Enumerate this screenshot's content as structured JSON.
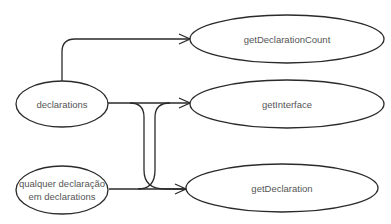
{
  "diagram": {
    "type": "flow-graph",
    "nodes": [
      {
        "id": "declarations",
        "label": "declarations"
      },
      {
        "id": "qualquer",
        "label_line1": "qualquer declaração",
        "label_line2": "em declarations"
      },
      {
        "id": "getDeclarationCount",
        "label": "getDeclarationCount"
      },
      {
        "id": "getInterface",
        "label": "getInterface"
      },
      {
        "id": "getDeclaration",
        "label": "getDeclaration"
      }
    ],
    "edges": [
      {
        "from": "declarations",
        "to": "getDeclarationCount"
      },
      {
        "from": "declarations",
        "to": "getInterface"
      },
      {
        "from": "declarations",
        "to": "getDeclaration"
      },
      {
        "from": "qualquer",
        "to": "getDeclaration"
      },
      {
        "from": "qualquer",
        "to": "getInterface"
      }
    ]
  }
}
